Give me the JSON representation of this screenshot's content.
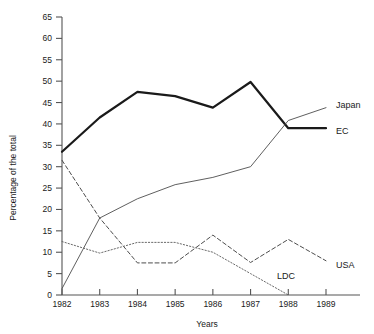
{
  "chart_data": {
    "type": "line",
    "title": "",
    "xlabel": "Years",
    "ylabel": "Percentage of the total",
    "x": [
      1982,
      1983,
      1984,
      1985,
      1986,
      1987,
      1988,
      1989
    ],
    "xtick_labels": [
      "1982",
      "1983",
      "1984",
      "1985",
      "1986",
      "1987",
      "1988",
      "1989"
    ],
    "ytick_labels": [
      "0",
      "5",
      "10",
      "15",
      "20",
      "25",
      "30",
      "35",
      "40",
      "45",
      "50",
      "55",
      "60",
      "65"
    ],
    "ytick_values": [
      0,
      5,
      10,
      15,
      20,
      25,
      30,
      35,
      40,
      45,
      50,
      55,
      60,
      65
    ],
    "xlim": [
      1982,
      1989
    ],
    "ylim": [
      0,
      65
    ],
    "grid": false,
    "legend_position": "line-end-labels",
    "series": [
      {
        "name": "EC",
        "label": "EC",
        "style": "solid-thick",
        "color": "#1a1a1a",
        "values": [
          33.5,
          41.5,
          47.5,
          46.5,
          43.8,
          49.8,
          39.0,
          39.0
        ]
      },
      {
        "name": "Japan",
        "label": "Japan",
        "style": "solid-thin",
        "color": "#4d4d4d",
        "values": [
          1.5,
          18.0,
          22.5,
          25.8,
          27.5,
          30.0,
          40.8,
          43.8
        ]
      },
      {
        "name": "USA",
        "label": "USA",
        "style": "dashed",
        "color": "#4d4d4d",
        "values": [
          31.5,
          18.0,
          7.5,
          7.5,
          14.0,
          7.6,
          13.0,
          8.0
        ]
      },
      {
        "name": "LDC",
        "label": "LDC",
        "style": "dotted",
        "color": "#6a6a6a",
        "values": [
          12.5,
          9.8,
          12.3,
          12.3,
          10.0,
          5.0,
          0.0,
          null
        ]
      }
    ]
  },
  "axis": {
    "y_title": "Percentage of the total",
    "x_title": "Years"
  }
}
